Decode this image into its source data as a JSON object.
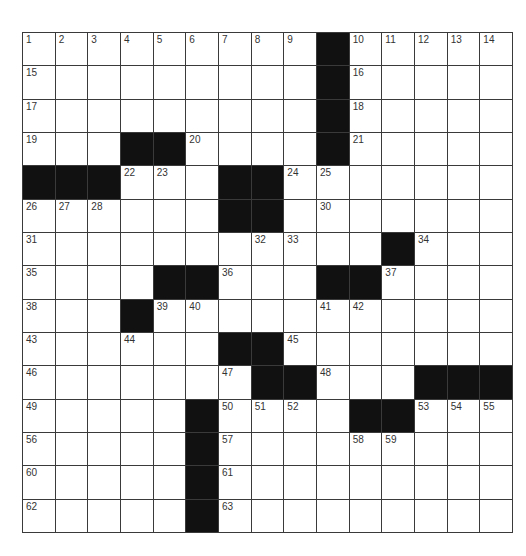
{
  "puzzle": {
    "rows": 15,
    "cols": 15,
    "colors": {
      "black_square": "#111111",
      "white_square": "#ffffff",
      "grid_line": "#3a3a3a",
      "number_text": "#333333"
    },
    "layout": [
      ".........#.....",
      ".........#.....",
      ".........#.....",
      "...##....#.....",
      "###...##.......",
      "......##.......",
      "...........#...",
      "....##...##....",
      "...#...........",
      "......##.......",
      ".......##...###",
      ".....#....##...",
      ".....#.........",
      ".....#.........",
      ".....#........."
    ],
    "numbers": [
      {
        "r": 0,
        "c": 0,
        "n": "1"
      },
      {
        "r": 0,
        "c": 1,
        "n": "2"
      },
      {
        "r": 0,
        "c": 2,
        "n": "3"
      },
      {
        "r": 0,
        "c": 3,
        "n": "4"
      },
      {
        "r": 0,
        "c": 4,
        "n": "5"
      },
      {
        "r": 0,
        "c": 5,
        "n": "6"
      },
      {
        "r": 0,
        "c": 6,
        "n": "7"
      },
      {
        "r": 0,
        "c": 7,
        "n": "8"
      },
      {
        "r": 0,
        "c": 8,
        "n": "9"
      },
      {
        "r": 0,
        "c": 10,
        "n": "10"
      },
      {
        "r": 0,
        "c": 11,
        "n": "11"
      },
      {
        "r": 0,
        "c": 12,
        "n": "12"
      },
      {
        "r": 0,
        "c": 13,
        "n": "13"
      },
      {
        "r": 0,
        "c": 14,
        "n": "14"
      },
      {
        "r": 1,
        "c": 0,
        "n": "15"
      },
      {
        "r": 1,
        "c": 10,
        "n": "16"
      },
      {
        "r": 2,
        "c": 0,
        "n": "17"
      },
      {
        "r": 2,
        "c": 10,
        "n": "18"
      },
      {
        "r": 3,
        "c": 0,
        "n": "19"
      },
      {
        "r": 3,
        "c": 5,
        "n": "20"
      },
      {
        "r": 3,
        "c": 10,
        "n": "21"
      },
      {
        "r": 4,
        "c": 3,
        "n": "22"
      },
      {
        "r": 4,
        "c": 4,
        "n": "23"
      },
      {
        "r": 4,
        "c": 8,
        "n": "24"
      },
      {
        "r": 4,
        "c": 9,
        "n": "25"
      },
      {
        "r": 5,
        "c": 0,
        "n": "26"
      },
      {
        "r": 5,
        "c": 1,
        "n": "27"
      },
      {
        "r": 5,
        "c": 2,
        "n": "28"
      },
      {
        "r": 5,
        "c": 6,
        "n": "29"
      },
      {
        "r": 5,
        "c": 9,
        "n": "30"
      },
      {
        "r": 6,
        "c": 0,
        "n": "31"
      },
      {
        "r": 6,
        "c": 7,
        "n": "32"
      },
      {
        "r": 6,
        "c": 8,
        "n": "33"
      },
      {
        "r": 6,
        "c": 12,
        "n": "34"
      },
      {
        "r": 7,
        "c": 0,
        "n": "35"
      },
      {
        "r": 7,
        "c": 6,
        "n": "36"
      },
      {
        "r": 7,
        "c": 11,
        "n": "37"
      },
      {
        "r": 8,
        "c": 0,
        "n": "38"
      },
      {
        "r": 8,
        "c": 4,
        "n": "39"
      },
      {
        "r": 8,
        "c": 5,
        "n": "40"
      },
      {
        "r": 8,
        "c": 9,
        "n": "41"
      },
      {
        "r": 8,
        "c": 10,
        "n": "42"
      },
      {
        "r": 9,
        "c": 0,
        "n": "43"
      },
      {
        "r": 9,
        "c": 3,
        "n": "44"
      },
      {
        "r": 9,
        "c": 8,
        "n": "45"
      },
      {
        "r": 10,
        "c": 0,
        "n": "46"
      },
      {
        "r": 10,
        "c": 6,
        "n": "47"
      },
      {
        "r": 10,
        "c": 9,
        "n": "48"
      },
      {
        "r": 11,
        "c": 0,
        "n": "49"
      },
      {
        "r": 11,
        "c": 6,
        "n": "50"
      },
      {
        "r": 11,
        "c": 7,
        "n": "51"
      },
      {
        "r": 11,
        "c": 8,
        "n": "52"
      },
      {
        "r": 11,
        "c": 12,
        "n": "53"
      },
      {
        "r": 11,
        "c": 13,
        "n": "54"
      },
      {
        "r": 11,
        "c": 14,
        "n": "55"
      },
      {
        "r": 12,
        "c": 0,
        "n": "56"
      },
      {
        "r": 12,
        "c": 6,
        "n": "57"
      },
      {
        "r": 12,
        "c": 10,
        "n": "58"
      },
      {
        "r": 12,
        "c": 11,
        "n": "59"
      },
      {
        "r": 13,
        "c": 0,
        "n": "60"
      },
      {
        "r": 13,
        "c": 6,
        "n": "61"
      },
      {
        "r": 14,
        "c": 0,
        "n": "62"
      },
      {
        "r": 14,
        "c": 6,
        "n": "63"
      }
    ]
  }
}
